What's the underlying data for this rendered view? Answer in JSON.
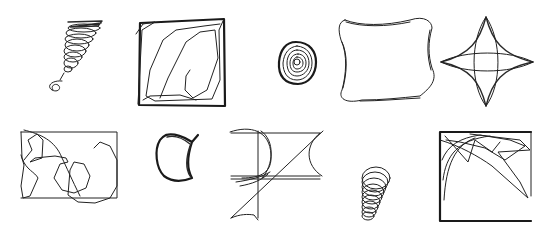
{
  "grid": {
    "rows": 2,
    "columns": 5,
    "background": "#ffffff",
    "stroke_color": "#222222"
  },
  "sketches": [
    {
      "id": "tornado-spiral",
      "row": 0,
      "col": 0
    },
    {
      "id": "scribbled-square",
      "row": 0,
      "col": 1
    },
    {
      "id": "concentric-spiral-blob",
      "row": 0,
      "col": 2
    },
    {
      "id": "wavy-rounded-square",
      "row": 0,
      "col": 3
    },
    {
      "id": "four-point-star",
      "row": 0,
      "col": 4
    },
    {
      "id": "rectangle-with-loops",
      "row": 1,
      "col": 0
    },
    {
      "id": "thick-crescent-cup",
      "row": 1,
      "col": 1
    },
    {
      "id": "geometric-construction",
      "row": 1,
      "col": 2
    },
    {
      "id": "vertical-coil",
      "row": 1,
      "col": 3
    },
    {
      "id": "square-with-corner-fan",
      "row": 1,
      "col": 4
    }
  ]
}
